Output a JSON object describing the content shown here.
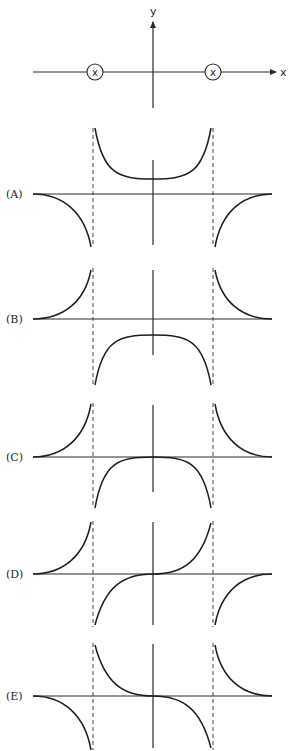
{
  "figure": {
    "top_diagram": {
      "x_axis_label": "x",
      "y_axis_label": "y",
      "charge_symbol": "x",
      "charges": [
        {
          "cx": 95,
          "cy": 72,
          "r": 8
        },
        {
          "cx": 213,
          "cy": 72,
          "r": 8
        }
      ],
      "x_axis": {
        "x1": 33,
        "x2": 276,
        "y": 72
      },
      "y_axis": {
        "x": 153,
        "y1": 108,
        "y2": 22
      }
    },
    "options": [
      {
        "label": "(A)",
        "axis_y": 194,
        "vaxis": [
          160,
          245
        ],
        "asym": [
          128,
          247
        ],
        "description": "Positive U-shaped curve between asymptotes with minimum above axis; negative curves outside asymptotes approaching zero"
      },
      {
        "label": "(B)",
        "axis_y": 319,
        "vaxis": [
          270,
          355
        ],
        "asym": [
          268,
          385
        ],
        "description": "Positive curves outside asymptotes rising toward them; negative dome between asymptotes with maximum below axis"
      },
      {
        "label": "(C)",
        "axis_y": 457,
        "vaxis": [
          405,
          492
        ],
        "asym": [
          403,
          508
        ],
        "description": "Positive curves outside asymptotes; negative dome between asymptotes touching zero at origin"
      },
      {
        "label": "(D)",
        "axis_y": 574,
        "vaxis": [
          522,
          625
        ],
        "asym": [
          521,
          627
        ],
        "description": "Left outer curve positive; S-shaped curve between asymptotes rising through origin from negative to positive; right outer curve negative"
      },
      {
        "label": "(E)",
        "axis_y": 696,
        "vaxis": [
          644,
          748
        ],
        "asym": [
          643,
          750
        ],
        "description": "Left outer curve negative; S-shaped curve between asymptotes falling through origin from positive to negative; right outer curve positive"
      }
    ],
    "layout": {
      "line_x_start": 33,
      "line_x_end": 272,
      "origin_x": 153,
      "asymptote_left_x": 93,
      "asymptote_right_x": 213,
      "label_x": 6
    }
  }
}
